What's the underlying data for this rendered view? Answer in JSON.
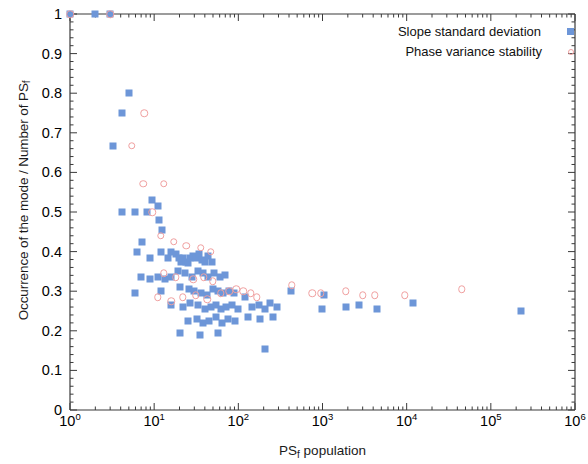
{
  "chart_data": {
    "type": "scatter",
    "title": "",
    "xlabel": "PS_f population",
    "xlabel_base": "PS",
    "xlabel_sub": "f",
    "xlabel_tail": " population",
    "ylabel": "Occurrence of the mode / Number of PS_f",
    "ylabel_base": "Occurrence of the mode / Number of PS",
    "ylabel_sub": "f",
    "xscale": "log",
    "yscale": "linear",
    "xlim": [
      1,
      1000000
    ],
    "ylim": [
      0,
      1
    ],
    "grid": false,
    "x_tick_labels": [
      "10",
      "10",
      "10",
      "10",
      "10",
      "10",
      "10"
    ],
    "x_tick_exponents": [
      "0",
      "1",
      "2",
      "3",
      "4",
      "5",
      "6"
    ],
    "x_tick_values": [
      1,
      10,
      100,
      1000,
      10000,
      100000,
      1000000
    ],
    "y_tick_labels": [
      "0",
      "0.1",
      "0.2",
      "0.3",
      "0.4",
      "0.5",
      "0.6",
      "0.7",
      "0.8",
      "0.9",
      "1"
    ],
    "y_tick_values": [
      0,
      0.1,
      0.2,
      0.3,
      0.4,
      0.5,
      0.6,
      0.7,
      0.8,
      0.9,
      1.0
    ],
    "legend": {
      "position": "top-right",
      "entries": [
        {
          "label": "Slope standard deviation",
          "marker": "filled-square",
          "color": "#6d96d8"
        },
        {
          "label": "Phase variance stability",
          "marker": "open-circle",
          "color": "#f0a0a0"
        }
      ]
    },
    "series": [
      {
        "name": "Slope standard deviation",
        "marker": "filled-square",
        "color": "#6d96d8",
        "points": [
          [
            1.0,
            1.0
          ],
          [
            2.0,
            1.0
          ],
          [
            3.0,
            1.0
          ],
          [
            5.0,
            0.8
          ],
          [
            4.1,
            0.75
          ],
          [
            3.2,
            0.667
          ],
          [
            9.5,
            0.53
          ],
          [
            11.5,
            0.48
          ],
          [
            4.1,
            0.5
          ],
          [
            6.0,
            0.5
          ],
          [
            8.3,
            0.5
          ],
          [
            11.0,
            0.515
          ],
          [
            12.5,
            0.455
          ],
          [
            6.3,
            0.4
          ],
          [
            7.2,
            0.425
          ],
          [
            9.0,
            0.385
          ],
          [
            12.0,
            0.4
          ],
          [
            14.5,
            0.385
          ],
          [
            16.0,
            0.4
          ],
          [
            18.0,
            0.395
          ],
          [
            19.5,
            0.385
          ],
          [
            21.0,
            0.375
          ],
          [
            22.0,
            0.385
          ],
          [
            24.0,
            0.375
          ],
          [
            25.5,
            0.37
          ],
          [
            27.0,
            0.385
          ],
          [
            29.0,
            0.39
          ],
          [
            31.0,
            0.385
          ],
          [
            34.0,
            0.395
          ],
          [
            37.0,
            0.38
          ],
          [
            40.0,
            0.375
          ],
          [
            44.0,
            0.39
          ],
          [
            48.0,
            0.375
          ],
          [
            7.0,
            0.335
          ],
          [
            9.0,
            0.33
          ],
          [
            11.0,
            0.335
          ],
          [
            13.5,
            0.33
          ],
          [
            16.0,
            0.335
          ],
          [
            19.0,
            0.35
          ],
          [
            23.0,
            0.345
          ],
          [
            28.0,
            0.335
          ],
          [
            33.0,
            0.35
          ],
          [
            38.0,
            0.345
          ],
          [
            44.0,
            0.335
          ],
          [
            52.0,
            0.345
          ],
          [
            60.0,
            0.335
          ],
          [
            70.0,
            0.34
          ],
          [
            6.0,
            0.295
          ],
          [
            12.0,
            0.3
          ],
          [
            20.0,
            0.31
          ],
          [
            26.0,
            0.305
          ],
          [
            30.0,
            0.3
          ],
          [
            36.0,
            0.295
          ],
          [
            42.0,
            0.29
          ],
          [
            50.0,
            0.305
          ],
          [
            58.0,
            0.3
          ],
          [
            66.0,
            0.295
          ],
          [
            78.0,
            0.3
          ],
          [
            90.0,
            0.295
          ],
          [
            16.0,
            0.265
          ],
          [
            22.0,
            0.26
          ],
          [
            27.0,
            0.27
          ],
          [
            33.0,
            0.265
          ],
          [
            40.0,
            0.255
          ],
          [
            47.0,
            0.26
          ],
          [
            55.0,
            0.265
          ],
          [
            62.0,
            0.255
          ],
          [
            72.0,
            0.26
          ],
          [
            85.0,
            0.265
          ],
          [
            100.0,
            0.255
          ],
          [
            25.0,
            0.225
          ],
          [
            32.0,
            0.23
          ],
          [
            38.0,
            0.22
          ],
          [
            45.0,
            0.225
          ],
          [
            54.0,
            0.235
          ],
          [
            64.0,
            0.22
          ],
          [
            76.0,
            0.23
          ],
          [
            92.0,
            0.225
          ],
          [
            20.0,
            0.195
          ],
          [
            35.0,
            0.19
          ],
          [
            58.0,
            0.195
          ],
          [
            120.0,
            0.285
          ],
          [
            145.0,
            0.26
          ],
          [
            175.0,
            0.265
          ],
          [
            205.0,
            0.255
          ],
          [
            240.0,
            0.27
          ],
          [
            290.0,
            0.26
          ],
          [
            130.0,
            0.235
          ],
          [
            180.0,
            0.23
          ],
          [
            260.0,
            0.235
          ],
          [
            210.0,
            0.155
          ],
          [
            420.0,
            0.3
          ],
          [
            980.0,
            0.255
          ],
          [
            1050.0,
            0.29
          ],
          [
            1900.0,
            0.26
          ],
          [
            2700.0,
            0.265
          ],
          [
            4400.0,
            0.255
          ],
          [
            12000.0,
            0.27
          ],
          [
            230000.0,
            0.25
          ]
        ]
      },
      {
        "name": "Phase variance stability",
        "marker": "open-circle",
        "color": "#f0a0a0",
        "points": [
          [
            1.0,
            1.0
          ],
          [
            3.0,
            1.0
          ],
          [
            7.6,
            0.75
          ],
          [
            5.4,
            0.667
          ],
          [
            7.4,
            0.571
          ],
          [
            13.0,
            0.571
          ],
          [
            9.5,
            0.5
          ],
          [
            12.0,
            0.44
          ],
          [
            17.0,
            0.425
          ],
          [
            24.0,
            0.415
          ],
          [
            36.0,
            0.41
          ],
          [
            47.0,
            0.4
          ],
          [
            13.0,
            0.345
          ],
          [
            18.0,
            0.335
          ],
          [
            29.0,
            0.33
          ],
          [
            39.0,
            0.335
          ],
          [
            50.0,
            0.325
          ],
          [
            11.0,
            0.285
          ],
          [
            16.0,
            0.275
          ],
          [
            22.0,
            0.285
          ],
          [
            31.0,
            0.29
          ],
          [
            43.0,
            0.28
          ],
          [
            62.0,
            0.295
          ],
          [
            78.0,
            0.3
          ],
          [
            95.0,
            0.305
          ],
          [
            115.0,
            0.3
          ],
          [
            140.0,
            0.295
          ],
          [
            165.0,
            0.285
          ],
          [
            430.0,
            0.315
          ],
          [
            760.0,
            0.295
          ],
          [
            950.0,
            0.295
          ],
          [
            1900.0,
            0.3
          ],
          [
            3000.0,
            0.29
          ],
          [
            4200.0,
            0.29
          ],
          [
            9500.0,
            0.29
          ],
          [
            45000.0,
            0.305
          ]
        ]
      }
    ]
  }
}
